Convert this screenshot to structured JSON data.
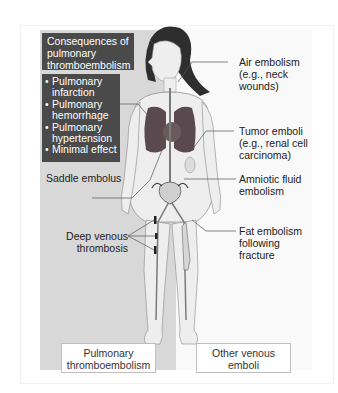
{
  "diagram": {
    "title": [
      "Consequences of",
      "pulmonary",
      "thromboembolism"
    ],
    "consequences": [
      {
        "line1": "Pulmonary",
        "line2": "infarction"
      },
      {
        "line1": "Pulmonary",
        "line2": "hemorrhage"
      },
      {
        "line1": "Pulmonary",
        "line2": "hypertension"
      },
      {
        "line1": "Minimal effect",
        "line2": ""
      }
    ],
    "left_labels": {
      "saddle_embolus": "Saddle embolus",
      "deep_venous_thrombosis": [
        "Deep venous",
        "thrombosis"
      ]
    },
    "right_labels": {
      "air_embolism": [
        "Air embolism",
        "(e.g., neck",
        "wounds)"
      ],
      "tumor_emboli": [
        "Tumor emboli",
        "(e.g., renal cell",
        "carcinoma)"
      ],
      "amniotic_fluid": [
        "Amniotic fluid",
        "embolism"
      ],
      "fat_embolism": [
        "Fat embolism",
        "following",
        "fracture"
      ]
    },
    "panels": {
      "left": [
        "Pulmonary",
        "thromboembolism"
      ],
      "right": [
        "Other venous",
        "emboli"
      ]
    },
    "colors": {
      "left_panel": "#d8d8d8",
      "right_panel": "#f9f9f9",
      "dark_box": "#4a4a4a",
      "lungs": "#5a4a50"
    }
  }
}
